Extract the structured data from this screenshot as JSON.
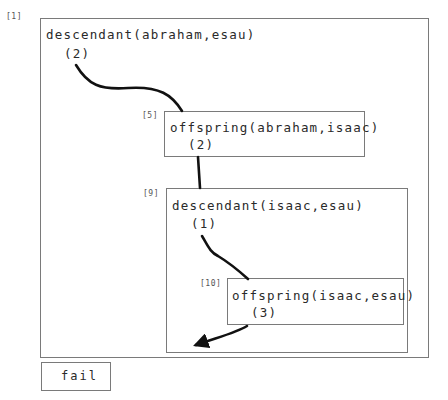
{
  "diagram": {
    "type": "prolog-proof-trace",
    "frames": [
      {
        "id": "[1]",
        "goal": "descendant(abraham,esau)",
        "count": "(2)"
      },
      {
        "id": "[5]",
        "goal": "offspring(abraham,isaac)",
        "count": "(2)"
      },
      {
        "id": "[9]",
        "goal": "descendant(isaac,esau)",
        "count": "(1)"
      },
      {
        "id": "[10]",
        "goal": "offspring(isaac,esau)",
        "count": "(3)"
      }
    ],
    "result": {
      "label": "fail"
    },
    "colors": {
      "border": "#7a7a7a",
      "arrow": "#111111",
      "text": "#2a2a2a"
    }
  }
}
